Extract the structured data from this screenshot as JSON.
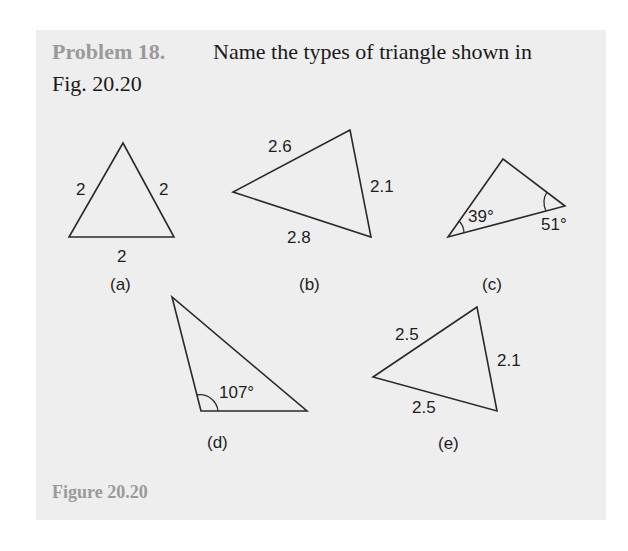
{
  "problem": {
    "label": "Problem 18.",
    "text_line1": "Name the types of triangle shown in",
    "text_line2": "Fig. 20.20"
  },
  "figure": {
    "caption": "Figure 20.20",
    "triangles": [
      {
        "id": "a",
        "caption": "(a)",
        "sides": [
          "2",
          "2",
          "2"
        ]
      },
      {
        "id": "b",
        "caption": "(b)",
        "sides": [
          "2.6",
          "2.1",
          "2.8"
        ]
      },
      {
        "id": "c",
        "caption": "(c)",
        "angles": [
          "39°",
          "51°"
        ]
      },
      {
        "id": "d",
        "caption": "(d)",
        "angles": [
          "107°"
        ]
      },
      {
        "id": "e",
        "caption": "(e)",
        "sides": [
          "2.5",
          "2.1",
          "2.5"
        ]
      }
    ]
  },
  "colors": {
    "panel_background": "#eeeeee",
    "label_gray": "#9a9a9a",
    "text": "#1a1a1a",
    "stroke": "#2a2a2a"
  }
}
